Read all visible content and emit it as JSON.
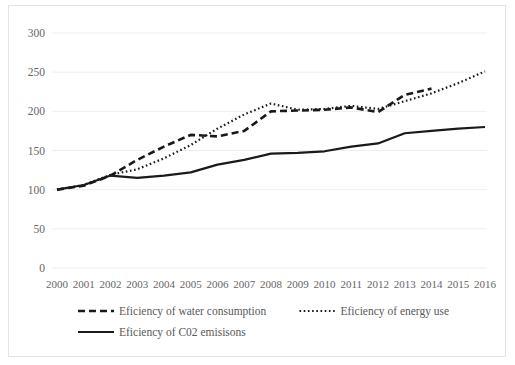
{
  "chart_data": {
    "type": "line",
    "title": "",
    "xlabel": "",
    "ylabel": "",
    "ylim": [
      0,
      300
    ],
    "yticks": [
      0,
      50,
      100,
      150,
      200,
      250,
      300
    ],
    "grid": true,
    "legend_position": "bottom",
    "categories": [
      "2000",
      "2001",
      "2002",
      "2003",
      "2004",
      "2005",
      "2006",
      "2007",
      "2008",
      "2009",
      "2010",
      "2011",
      "2012",
      "2013",
      "2014",
      "2015",
      "2016"
    ],
    "series": [
      {
        "name": "Eficiency of water consumption",
        "style": "dashed",
        "color": "#1a1a1a",
        "values": [
          100,
          105,
          118,
          138,
          155,
          170,
          168,
          175,
          200,
          201,
          202,
          205,
          199,
          221,
          229,
          null,
          null
        ]
      },
      {
        "name": "Eficiency of energy use",
        "style": "dotted",
        "color": "#1a1a1a",
        "values": [
          100,
          106,
          119,
          126,
          140,
          157,
          178,
          196,
          210,
          202,
          203,
          207,
          203,
          213,
          223,
          236,
          251
        ]
      },
      {
        "name": "Eficiency of C02 emisisons",
        "style": "solid",
        "color": "#1a1a1a",
        "values": [
          100,
          106,
          118,
          115,
          118,
          122,
          132,
          138,
          146,
          147,
          149,
          155,
          159,
          172,
          175,
          178,
          180
        ]
      }
    ]
  },
  "axis": {
    "y_labels": [
      "300",
      "250",
      "200",
      "150",
      "100",
      "50",
      "0"
    ],
    "x_labels": [
      "2000",
      "2001",
      "2002",
      "2003",
      "2004",
      "2005",
      "2006",
      "2007",
      "2008",
      "2009",
      "2010",
      "2011",
      "2012",
      "2013",
      "2014",
      "2015",
      "2016"
    ]
  },
  "legend": {
    "items": [
      {
        "label": "Eficiency of water consumption",
        "style": "dashed"
      },
      {
        "label": "Eficiency of energy use",
        "style": "dotted"
      },
      {
        "label": "Eficiency of C02 emisisons",
        "style": "solid"
      }
    ]
  }
}
